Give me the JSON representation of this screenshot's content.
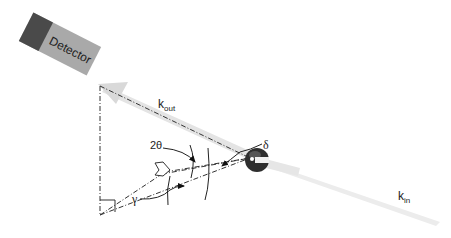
{
  "diagram": {
    "detector": {
      "label": "Detector",
      "colors": {
        "body": "#a9a9a9",
        "cap": "#4a4a4a"
      }
    },
    "vectors": {
      "k_out": {
        "base": "k",
        "sub": "out"
      },
      "k_in": {
        "base": "k",
        "sub": "in"
      }
    },
    "angles": {
      "two_theta": "2θ",
      "gamma": "γ",
      "delta": "δ"
    },
    "colors": {
      "beam": "#e3e3e3",
      "lines": "#333333",
      "sample": "#2a2a2a"
    }
  }
}
